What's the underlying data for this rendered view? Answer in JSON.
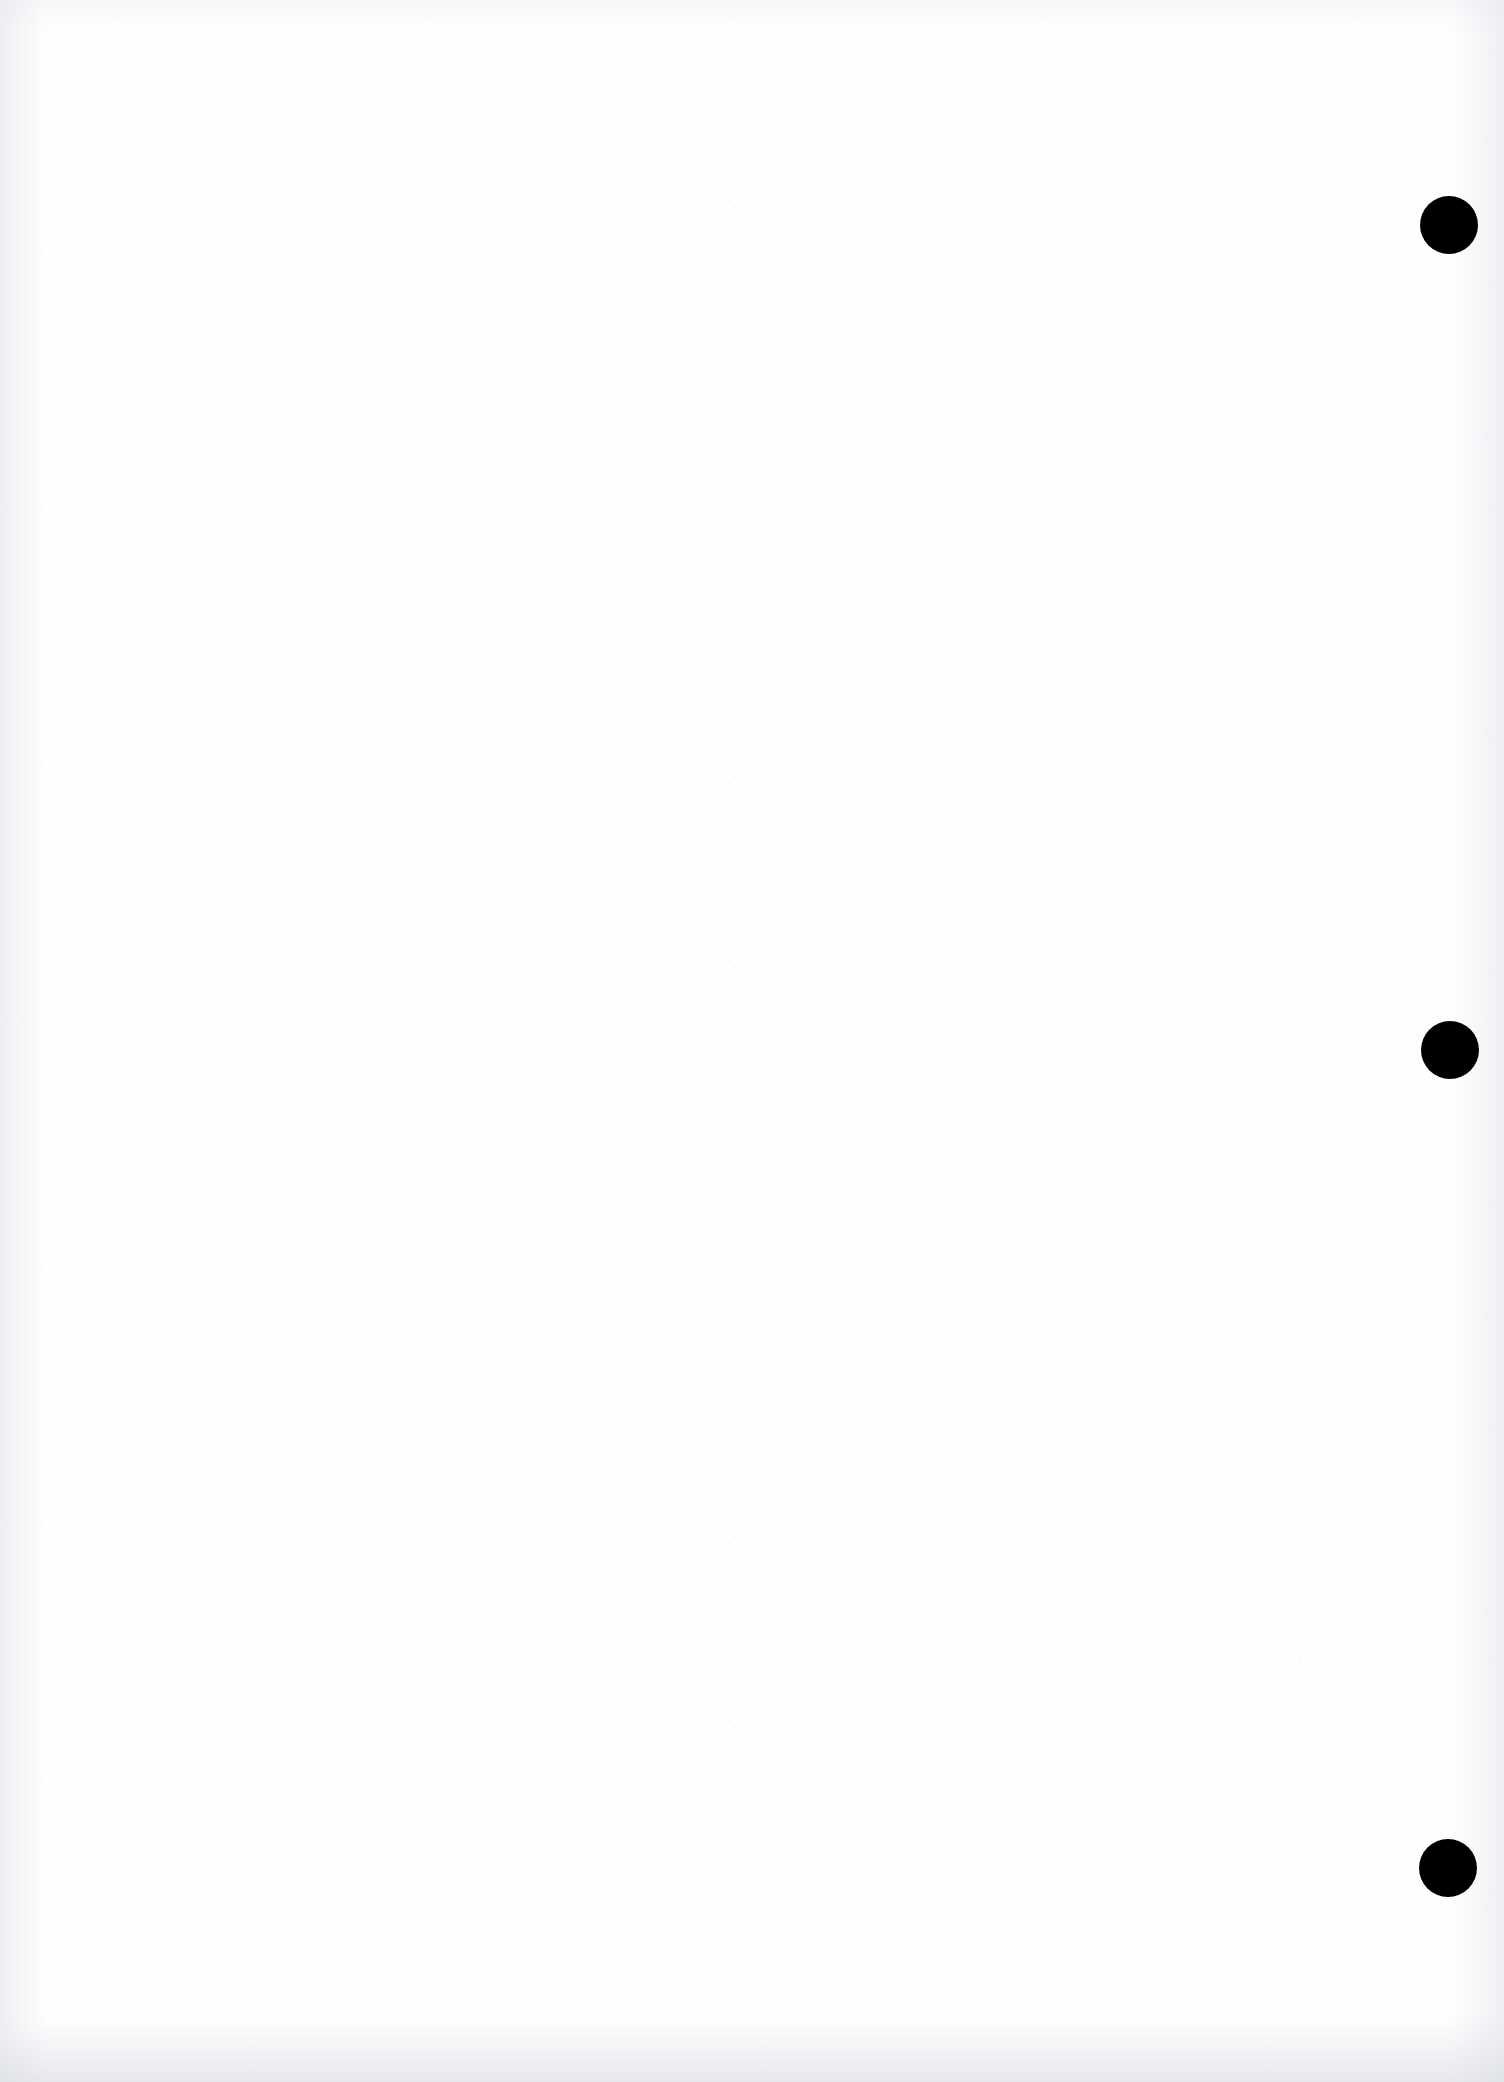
{
  "document": {
    "page_type": "scanned-blank-page",
    "page_width": 1504,
    "page_height": 2082,
    "background_color": "#fefeff",
    "body_text": ""
  },
  "marks": {
    "color": "#000000",
    "shape": "circle",
    "label": "registration-mark",
    "items": [
      {
        "id": "mark-1",
        "center_x": 1449,
        "center_y": 225,
        "diameter": 58
      },
      {
        "id": "mark-2",
        "center_x": 1450,
        "center_y": 1050,
        "diameter": 58
      },
      {
        "id": "mark-3",
        "center_x": 1448,
        "center_y": 1868,
        "diameter": 58
      }
    ]
  },
  "artifacts": {
    "ghost_text_line_1": "                                                                               ",
    "ghost_text_line_2": "                                                                       "
  }
}
